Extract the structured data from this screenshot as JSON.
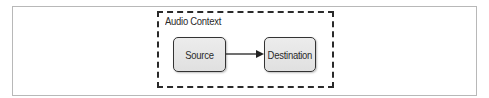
{
  "diagram": {
    "container": {
      "label": "Audio Context",
      "border_style": "dashed",
      "border_color": "#2a2a2a"
    },
    "nodes": [
      {
        "id": "source",
        "label": "Source",
        "fill": "#e6e6e6",
        "border": "#333333"
      },
      {
        "id": "destination",
        "label": "Destination",
        "fill": "#e6e6e6",
        "border": "#333333"
      }
    ],
    "edges": [
      {
        "from": "source",
        "to": "destination",
        "type": "arrow"
      }
    ],
    "frame_border_color": "#b8b8b8"
  }
}
